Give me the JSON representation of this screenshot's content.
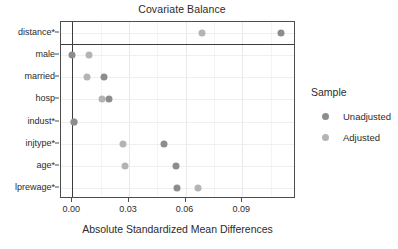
{
  "chart_data": {
    "type": "scatter",
    "title": "Covariate Balance",
    "xlabel": "Absolute Standardized Mean Differences",
    "ylabel": "",
    "xlim": [
      -0.006,
      0.1185
    ],
    "xticks": [
      0.0,
      0.03,
      0.06,
      0.09
    ],
    "xticklabels": [
      "0.00",
      "0.03",
      "0.06",
      "0.09"
    ],
    "grid": true,
    "legend_position": "right",
    "categories": [
      "distance*",
      "male",
      "married",
      "hosp",
      "indust*",
      "injtype*",
      "age*",
      "lprewage*"
    ],
    "series": [
      {
        "name": "Unadjusted",
        "color": "#8d8d8d",
        "values": [
          0.1103,
          0.0,
          0.017,
          0.0194,
          0.001,
          0.0485,
          0.0547,
          0.0557
        ]
      },
      {
        "name": "Adjusted",
        "color": "#b4b4b4",
        "values": [
          0.0685,
          0.0087,
          0.008,
          0.0158,
          0.001,
          0.027,
          0.028,
          0.0664
        ]
      }
    ],
    "annotations": [
      {
        "type": "hline",
        "name": "distance-separator",
        "after_category": "distance*"
      },
      {
        "type": "vline",
        "name": "zero-reference-line",
        "x": 0.0
      }
    ]
  },
  "legend": {
    "title": "Sample",
    "entries": [
      {
        "label": "Unadjusted",
        "color": "#8d8d8d"
      },
      {
        "label": "Adjusted",
        "color": "#b4b4b4"
      }
    ]
  }
}
